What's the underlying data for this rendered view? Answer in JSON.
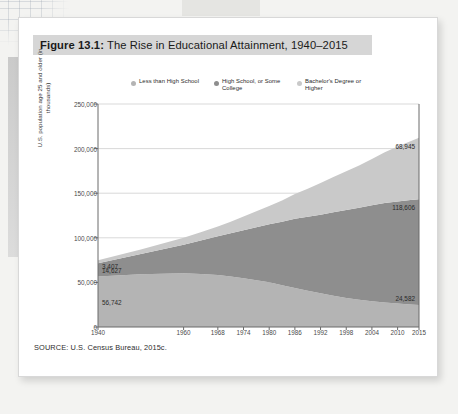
{
  "figure": {
    "number": "Figure 13.1:",
    "title": " The Rise in Educational Attainment, 1940–2015",
    "source": "SOURCE: U.S. Census Bureau, 2015c."
  },
  "colors": {
    "series_less_than_hs": "#b4b4b4",
    "series_hs_some_college": "#8e8e8e",
    "series_bachelors": "#c9c9c9",
    "title_band": "#d6d6d6",
    "grid": "#c9c9c9",
    "axis": "#6a6a6a",
    "page": "#ffffff"
  },
  "chart_data": {
    "type": "area",
    "title": "The Rise in Educational Attainment, 1940–2015",
    "xlabel": "",
    "ylabel": "U.S. population age 25 and older (in thousands)",
    "stacked": true,
    "grid": true,
    "legend_position": "top",
    "ylim": [
      0,
      250000
    ],
    "yticks": [
      "0",
      "50,000",
      "100,000",
      "150,000",
      "200,000",
      "250,000"
    ],
    "ytick_values": [
      0,
      50000,
      100000,
      150000,
      200000,
      250000
    ],
    "xlim": [
      1940,
      2015
    ],
    "xticks": [
      "1940",
      "1960",
      "1968",
      "1974",
      "1980",
      "1986",
      "1992",
      "1998",
      "2004",
      "2010",
      "2015"
    ],
    "xtick_values": [
      1940,
      1960,
      1968,
      1974,
      1980,
      1986,
      1992,
      1998,
      2004,
      2010,
      2015
    ],
    "x": [
      1940,
      1950,
      1960,
      1964,
      1968,
      1971,
      1974,
      1977,
      1980,
      1983,
      1986,
      1989,
      1992,
      1995,
      1998,
      2001,
      2004,
      2007,
      2010,
      2013,
      2015
    ],
    "series": [
      {
        "name": "Less than High School",
        "color": "#b4b4b4",
        "order": "bottom",
        "values": [
          56742,
          59200,
          60300,
          59500,
          58200,
          56500,
          54600,
          52400,
          50100,
          46900,
          43800,
          40600,
          37900,
          35100,
          32600,
          30600,
          28900,
          27400,
          26300,
          25300,
          24582
        ]
      },
      {
        "name": "High School, or Some College",
        "color": "#8e8e8e",
        "order": "middle",
        "values": [
          14627,
          22500,
          32000,
          37500,
          43500,
          48500,
          54000,
          59500,
          65000,
          71000,
          77500,
          83000,
          88000,
          93500,
          98500,
          103000,
          107500,
          111500,
          114500,
          117000,
          118606
        ]
      },
      {
        "name": "Bachelor's Degree or Higher",
        "color": "#c9c9c9",
        "order": "top",
        "values": [
          3407,
          5300,
          7700,
          9200,
          11000,
          13000,
          15200,
          17800,
          20500,
          24000,
          27800,
          31500,
          35500,
          39500,
          43500,
          47500,
          52000,
          57000,
          61500,
          66000,
          68945
        ]
      }
    ],
    "annotations": [
      {
        "text": "3,407",
        "series": "Bachelor's Degree or Higher",
        "side": "left",
        "year": 1940
      },
      {
        "text": "14,627",
        "series": "High School, or Some College",
        "side": "left",
        "year": 1940
      },
      {
        "text": "56,742",
        "series": "Less than High School",
        "side": "left",
        "year": 1940
      },
      {
        "text": "68,945",
        "series": "Bachelor's Degree or Higher",
        "side": "right",
        "year": 2015
      },
      {
        "text": "118,606",
        "series": "High School, or Some College",
        "side": "right",
        "year": 2015
      },
      {
        "text": "24,582",
        "series": "Less than High School",
        "side": "right",
        "year": 2015
      }
    ],
    "legend": [
      {
        "label": "Less than High School",
        "color": "#b4b4b4"
      },
      {
        "label": "High School, or Some College",
        "color": "#8e8e8e"
      },
      {
        "label": "Bachelor's Degree or Higher",
        "color": "#c9c9c9"
      }
    ]
  }
}
